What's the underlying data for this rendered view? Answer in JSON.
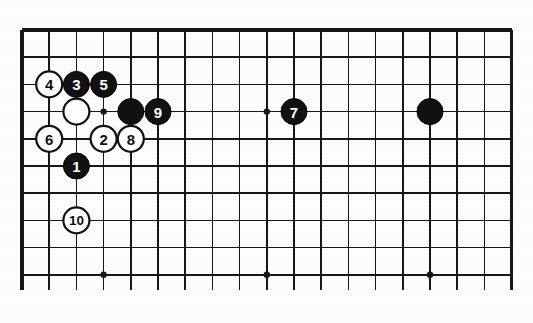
{
  "figure": {
    "board_size": 19,
    "visible_region": "upper-left portion of a 19x19 go board, cropped at bottom",
    "background_color": "#fdfdfb",
    "line_color": "#171717"
  },
  "geometry": {
    "origin_x": 22,
    "origin_y": 30,
    "spacing": 27.2,
    "columns_visible": 19,
    "rows_visible": 10,
    "stone_radius": 13,
    "bottom_cut_y": 290
  },
  "star_points": [
    {
      "col": 3,
      "row": 3
    },
    {
      "col": 9,
      "row": 3
    },
    {
      "col": 3,
      "row": 9
    },
    {
      "col": 9,
      "row": 9
    },
    {
      "col": 15,
      "row": 9
    }
  ],
  "stones": [
    {
      "id": "stone-4",
      "color": "white",
      "label": "4",
      "col": 1,
      "row": 2
    },
    {
      "id": "stone-3",
      "color": "black",
      "label": "3",
      "col": 2,
      "row": 2
    },
    {
      "id": "stone-5",
      "color": "black",
      "label": "5",
      "col": 3,
      "row": 2
    },
    {
      "id": "stone-white-preplaced-a",
      "color": "white",
      "label": "",
      "col": 2,
      "row": 3
    },
    {
      "id": "stone-black-preplaced-a",
      "color": "black",
      "label": "",
      "col": 4,
      "row": 3
    },
    {
      "id": "stone-9",
      "color": "black",
      "label": "9",
      "col": 5,
      "row": 3
    },
    {
      "id": "stone-7",
      "color": "black",
      "label": "7",
      "col": 10,
      "row": 3
    },
    {
      "id": "stone-black-preplaced-b",
      "color": "black",
      "label": "",
      "col": 15,
      "row": 3
    },
    {
      "id": "stone-6",
      "color": "white",
      "label": "6",
      "col": 1,
      "row": 4
    },
    {
      "id": "stone-2",
      "color": "white",
      "label": "2",
      "col": 3,
      "row": 4
    },
    {
      "id": "stone-8",
      "color": "white",
      "label": "8",
      "col": 4,
      "row": 4
    },
    {
      "id": "stone-1",
      "color": "black",
      "label": "1",
      "col": 2,
      "row": 5
    },
    {
      "id": "stone-10",
      "color": "white",
      "label": "10",
      "col": 2,
      "row": 7
    }
  ],
  "move_sequence": {
    "moves": [
      "1",
      "2",
      "3",
      "4",
      "5",
      "6",
      "7",
      "8",
      "9",
      "10"
    ],
    "black_moves": [
      "1",
      "3",
      "5",
      "7",
      "9"
    ],
    "white_moves": [
      "2",
      "4",
      "6",
      "8",
      "10"
    ]
  }
}
